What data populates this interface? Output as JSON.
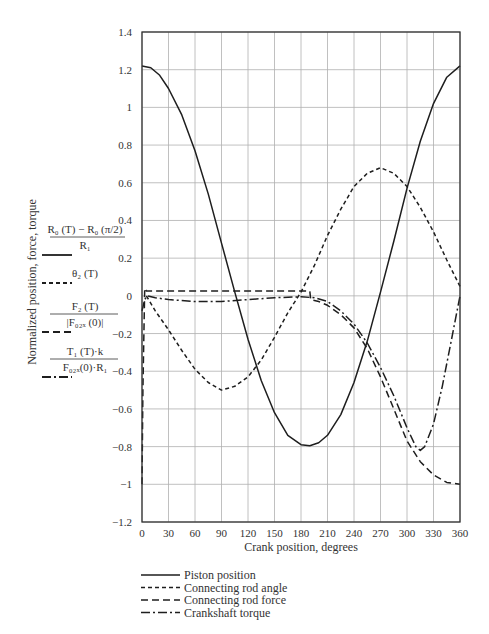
{
  "chart_data": {
    "type": "line",
    "title": "",
    "xlabel": "Crank position, degrees",
    "ylabel": "Normalized position, force, torque",
    "xlim": [
      0,
      360
    ],
    "ylim": [
      -1.2,
      1.4
    ],
    "grid": true,
    "x_ticks": [
      0,
      30,
      60,
      90,
      120,
      150,
      180,
      210,
      240,
      270,
      300,
      330,
      360
    ],
    "y_ticks": [
      -1.2,
      -1,
      -0.8,
      -0.6,
      -0.4,
      -0.2,
      0,
      0.2,
      0.4,
      0.6,
      0.8,
      1,
      1.2,
      1.4
    ],
    "y_tick_labels": [
      "−1.2",
      "−1",
      "−0.8",
      "−0.6",
      "−0.4",
      "−0.2",
      "0",
      "0.2",
      "0.4",
      "0.6",
      "0.8",
      "1",
      "1.2",
      "1.4"
    ],
    "legend_position": "below",
    "series": [
      {
        "name": "Piston position",
        "style": "solid",
        "x": [
          0,
          10,
          20,
          30,
          45,
          60,
          75,
          90,
          105,
          120,
          135,
          150,
          165,
          180,
          190,
          200,
          210,
          225,
          240,
          255,
          270,
          285,
          300,
          315,
          330,
          345,
          360
        ],
        "y": [
          1.22,
          1.21,
          1.17,
          1.1,
          0.96,
          0.77,
          0.54,
          0.28,
          0.02,
          -0.23,
          -0.45,
          -0.62,
          -0.74,
          -0.79,
          -0.795,
          -0.78,
          -0.74,
          -0.63,
          -0.46,
          -0.24,
          0.02,
          0.29,
          0.57,
          0.82,
          1.02,
          1.16,
          1.22
        ]
      },
      {
        "name": "Connecting rod angle",
        "style": "short-dash",
        "x": [
          5,
          15,
          30,
          45,
          60,
          75,
          90,
          105,
          120,
          135,
          150,
          165,
          180,
          195,
          210,
          225,
          240,
          255,
          270,
          285,
          300,
          315,
          330,
          345,
          360
        ],
        "y": [
          0.0,
          -0.08,
          -0.18,
          -0.29,
          -0.39,
          -0.46,
          -0.5,
          -0.48,
          -0.43,
          -0.34,
          -0.22,
          -0.09,
          0.02,
          0.16,
          0.32,
          0.46,
          0.58,
          0.65,
          0.68,
          0.65,
          0.58,
          0.47,
          0.34,
          0.19,
          0.05
        ]
      },
      {
        "name": "Connecting rod force",
        "style": "long-dash",
        "x": [
          0,
          1,
          3,
          5,
          30,
          60,
          90,
          120,
          150,
          180,
          190,
          191,
          200,
          210,
          225,
          240,
          255,
          270,
          285,
          300,
          315,
          330,
          345,
          360
        ],
        "y": [
          -1.0,
          -0.5,
          0.04,
          0.025,
          0.025,
          0.025,
          0.025,
          0.025,
          0.025,
          0.025,
          0.025,
          -0.02,
          -0.03,
          -0.05,
          -0.1,
          -0.17,
          -0.28,
          -0.43,
          -0.6,
          -0.77,
          -0.88,
          -0.95,
          -0.99,
          -1.0
        ]
      },
      {
        "name": "Crankshaft torque",
        "style": "dash-dot",
        "x": [
          0,
          3,
          6,
          15,
          30,
          60,
          90,
          120,
          150,
          180,
          195,
          210,
          225,
          240,
          255,
          270,
          285,
          300,
          310,
          315,
          320,
          330,
          340,
          350,
          360
        ],
        "y": [
          -0.08,
          -0.02,
          0.0,
          -0.01,
          -0.02,
          -0.03,
          -0.03,
          -0.02,
          -0.01,
          -0.005,
          -0.01,
          -0.03,
          -0.08,
          -0.15,
          -0.25,
          -0.38,
          -0.53,
          -0.7,
          -0.8,
          -0.82,
          -0.8,
          -0.68,
          -0.48,
          -0.24,
          0.0
        ]
      }
    ],
    "side_legend": [
      {
        "numerator": "R₀ (T) − R₀ (π/2)",
        "denominator": "R₁",
        "style": "solid"
      },
      {
        "numerator": "θ₂ (T)",
        "denominator": "",
        "style": "short-dash"
      },
      {
        "numerator": "F₂ (T)",
        "denominator": "|F₀₂ₓ (0)|",
        "style": "long-dash"
      },
      {
        "numerator": "T₁ (T)·k",
        "denominator": "F₀₂ₓ(0)·R₁",
        "style": "dash-dot"
      }
    ]
  }
}
